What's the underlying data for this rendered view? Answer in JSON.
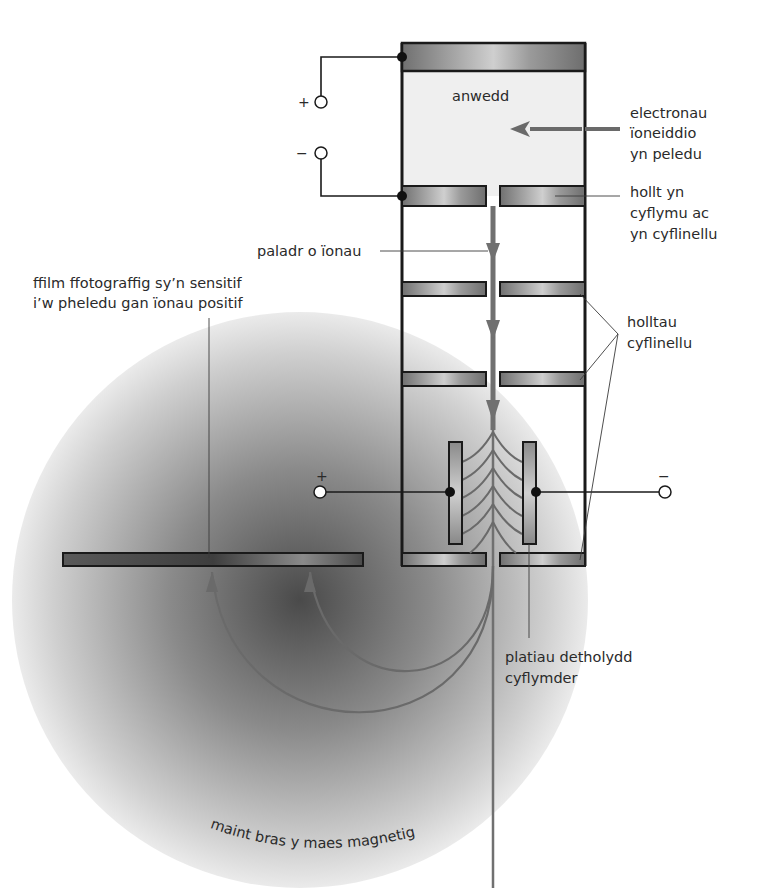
{
  "diagram": {
    "type": "mass-spectrometer",
    "colors": {
      "frame": "#1a1a1a",
      "beam": "#707070",
      "plate_dark": "#7a7a7a",
      "plate_light": "#c8c8c8",
      "field_center": "#4a4a4a",
      "field_edge": "#e8e8e8",
      "vapour_fill": "#efefef",
      "film": "#555555"
    },
    "labels": {
      "vapour": "anwedd",
      "ionising_electrons": [
        "electronau",
        "ïoneiddio",
        "yn peledu"
      ],
      "accelerating_slit": [
        "hollt yn",
        "cyflymu ac",
        "yn cyflinellu"
      ],
      "ion_beam": "paladr o ïonau",
      "film": [
        "ffilm ffotograffig sy’n sensitif",
        "i’w pheledu gan ïonau positif"
      ],
      "collimating_slits": [
        "holltau",
        "cyflinellu"
      ],
      "velocity_selector": [
        "platiau detholydd",
        "cyflymder"
      ],
      "magnetic_field": "maint bras y maes magnetig"
    },
    "terminals": {
      "top_plus": "+",
      "top_minus": "−",
      "selector_plus": "+",
      "selector_minus": "−"
    }
  }
}
